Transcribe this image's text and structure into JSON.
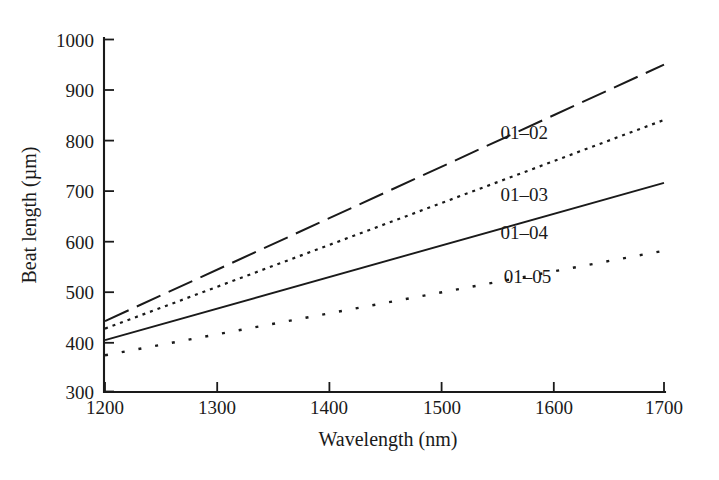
{
  "chart_data": {
    "type": "line",
    "title": "",
    "xlabel": "Wavelength (nm)",
    "ylabel": "Beat length (µm)",
    "xlim": [
      1200,
      1700
    ],
    "ylim": [
      300,
      1000
    ],
    "xticks": [
      1200,
      1300,
      1400,
      1500,
      1600,
      1700
    ],
    "yticks": [
      300,
      400,
      500,
      600,
      700,
      800,
      900,
      1000
    ],
    "xtick_labels": [
      "1200",
      "1300",
      "1400",
      "1500",
      "1600",
      "1700"
    ],
    "ytick_labels": [
      "300",
      "400",
      "500",
      "600",
      "700",
      "800",
      "900",
      "1000"
    ],
    "grid": false,
    "legend_position": "inline-right-annotations",
    "x": [
      1200,
      1700
    ],
    "series": [
      {
        "name": "01–02",
        "label": "01–02",
        "linestyle": "long-dash",
        "dasharray": "26 9",
        "linewidth": 2.0,
        "color": "#1a1a1a",
        "values": [
          440,
          950
        ],
        "label_x": 1575,
        "label_y": 815
      },
      {
        "name": "01–03",
        "label": "01–03",
        "linestyle": "fine-dotted",
        "dasharray": "3 5",
        "linewidth": 2.2,
        "color": "#1a1a1a",
        "values": [
          425,
          840
        ],
        "label_x": 1575,
        "label_y": 690
      },
      {
        "name": "01–04",
        "label": "01–04",
        "linestyle": "solid",
        "dasharray": "none",
        "linewidth": 1.9,
        "color": "#1a1a1a",
        "values": [
          402,
          715
        ],
        "label_x": 1575,
        "label_y": 615
      },
      {
        "name": "01–05",
        "label": "01–05",
        "linestyle": "sparse-dotted",
        "dasharray": "3 14",
        "linewidth": 2.4,
        "color": "#1a1a1a",
        "values": [
          372,
          580
        ],
        "label_x": 1578,
        "label_y": 527
      }
    ]
  },
  "axes": {
    "x_axis_title": "Wavelength (nm)",
    "y_axis_title": "Beat length (µm)"
  },
  "ticks": {
    "y": {
      "t1000": "1000",
      "t900": "900",
      "t800": "800",
      "t700": "700",
      "t600": "600",
      "t500": "500",
      "t400": "400",
      "t300": "300"
    },
    "x": {
      "t1200": "1200",
      "t1300": "1300",
      "t1400": "1400",
      "t1500": "1500",
      "t1600": "1600",
      "t1700": "1700"
    }
  },
  "series_labels": {
    "s1": "01–02",
    "s2": "01–03",
    "s3": "01–04",
    "s4": "01–05"
  }
}
